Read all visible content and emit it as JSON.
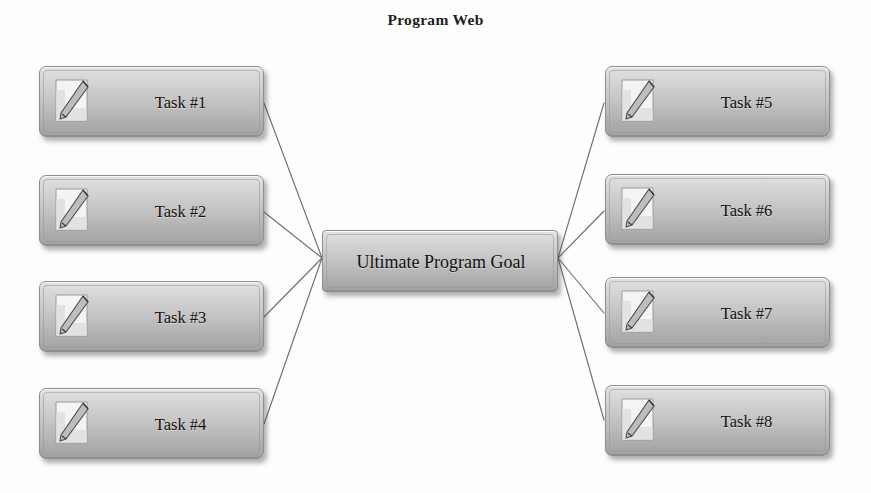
{
  "diagram": {
    "title": "Program Web",
    "center_node": {
      "label": "Ultimate Program Goal",
      "icon": "none"
    },
    "left_nodes": [
      {
        "label": "Task #1",
        "icon": "pencil-document-icon"
      },
      {
        "label": "Task #2",
        "icon": "pencil-document-icon"
      },
      {
        "label": "Task #3",
        "icon": "pencil-document-icon"
      },
      {
        "label": "Task #4",
        "icon": "pencil-document-icon"
      }
    ],
    "right_nodes": [
      {
        "label": "Task #5",
        "icon": "pencil-document-icon"
      },
      {
        "label": "Task #6",
        "icon": "pencil-document-icon"
      },
      {
        "label": "Task #7",
        "icon": "pencil-document-icon"
      },
      {
        "label": "Task #8",
        "icon": "pencil-document-icon"
      }
    ],
    "colors": {
      "background": "#fdfdfd",
      "node_fill_top": "#e2e2e2",
      "node_fill_bottom": "#a2a2a2",
      "node_border": "#8e8e8e",
      "connector_line": "#707070",
      "text": "#111111",
      "title_text": "#1d1d1d"
    },
    "connectors": {
      "left_hub_x": 322,
      "left_hub_y": 258,
      "right_hub_x": 557,
      "right_hub_y": 258,
      "count": 8
    }
  }
}
